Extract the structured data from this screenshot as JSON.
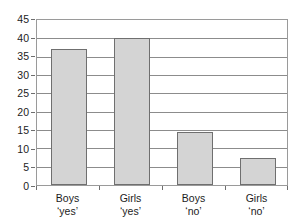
{
  "chart_data": {
    "type": "bar",
    "title": "",
    "subtitle": "",
    "xlabel": "",
    "ylabel": "",
    "categories": [
      "Boys 'yes'",
      "Girls 'yes'",
      "Boys 'no'",
      "Girls 'no'"
    ],
    "category_lines": [
      {
        "line1": "Boys",
        "line2": "‘yes’"
      },
      {
        "line1": "Girls",
        "line2": "‘yes’"
      },
      {
        "line1": "Boys",
        "line2": "‘no’"
      },
      {
        "line1": "Girls",
        "line2": "‘no’"
      }
    ],
    "values": [
      37,
      40,
      14.5,
      7.5
    ],
    "ylim": [
      0,
      45
    ],
    "ytick_step": 5,
    "yticks": [
      0,
      5,
      10,
      15,
      20,
      25,
      30,
      35,
      40,
      45
    ],
    "ytick_labels": [
      "0",
      "5",
      "10",
      "15",
      "20",
      "25",
      "30",
      "35",
      "40",
      "45"
    ],
    "grid": true,
    "grid_axis": "y",
    "legend": false,
    "legend_position": "none",
    "colors": {
      "bar_fill": "#d4d4d4",
      "bar_border": "#6f6f6f",
      "gridline": "#8c8c8c",
      "axis": "#6e6e6e",
      "frame": "#9a9a9a",
      "text": "#1c1c1c",
      "background": "#ffffff"
    }
  }
}
